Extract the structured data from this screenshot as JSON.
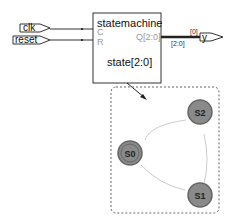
{
  "block": {
    "title": "statemachine",
    "ports_in": [
      "C",
      "R"
    ],
    "port_out": "Q[2:0]",
    "state": "state[2:0]"
  },
  "inputs": [
    "clk",
    "reset"
  ],
  "output": {
    "name": "y",
    "bus": "[2:0]",
    "bit": "[0]"
  },
  "fsm": {
    "states": [
      "S0",
      "S1",
      "S2"
    ],
    "initial": "S0"
  }
}
